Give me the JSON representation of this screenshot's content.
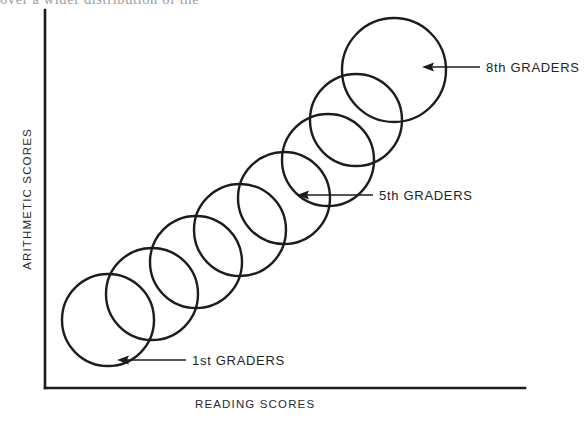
{
  "figure": {
    "cut_caption": "over a wider distribution of the",
    "axes": {
      "y_label": "ARITHMETIC SCORES",
      "x_label": "READING SCORES",
      "x_axis": {
        "x1": 45,
        "y1": 388,
        "x2": 525,
        "y2": 388
      },
      "y_axis": {
        "x1": 45,
        "y1": 10,
        "x2": 45,
        "y2": 388
      },
      "line_color": "#1c1c1c",
      "line_width": 2.6
    },
    "annotations": [
      {
        "id": "8th",
        "label": "8th GRADERS",
        "grade": 8,
        "arrow_tip_x": 422,
        "arrow_tip_y": 67,
        "leader_x": 480,
        "leader_y": 67
      },
      {
        "id": "5th",
        "label": "5th GRADERS",
        "grade": 5,
        "arrow_tip_x": 297,
        "arrow_tip_y": 195,
        "leader_x": 373,
        "leader_y": 195
      },
      {
        "id": "1st",
        "label": "1st GRADERS",
        "grade": 1,
        "arrow_tip_x": 117,
        "arrow_tip_y": 360,
        "leader_x": 186,
        "leader_y": 360
      }
    ]
  },
  "chart_data": {
    "type": "scatter",
    "title": "",
    "subtitle": "",
    "xlabel": "READING SCORES",
    "ylabel": "ARITHMETIC SCORES",
    "xlim": [
      0,
      100
    ],
    "ylim": [
      0,
      100
    ],
    "grid": false,
    "legend": "none",
    "stroke_color": "#1c1c1c",
    "stroke_width": 2.4,
    "fill": "none",
    "series": [
      {
        "name": "grade envelopes",
        "shape": "circle",
        "points": [
          {
            "grade": 1,
            "cx": 108,
            "cy": 320,
            "r": 46
          },
          {
            "grade": 2,
            "cx": 152,
            "cy": 294,
            "r": 46
          },
          {
            "grade": 3,
            "cx": 196,
            "cy": 262,
            "r": 46
          },
          {
            "grade": 4,
            "cx": 240,
            "cy": 230,
            "r": 46
          },
          {
            "grade": 5,
            "cx": 284,
            "cy": 198,
            "r": 46
          },
          {
            "grade": 6,
            "cx": 328,
            "cy": 160,
            "r": 46
          },
          {
            "grade": 7,
            "cx": 356,
            "cy": 120,
            "r": 46
          },
          {
            "grade": 8,
            "cx": 394,
            "cy": 70,
            "r": 52
          }
        ]
      }
    ],
    "annotated_grades": [
      1,
      5,
      8
    ],
    "annotation_labels": [
      "1st GRADERS",
      "5th GRADERS",
      "8th GRADERS"
    ]
  }
}
